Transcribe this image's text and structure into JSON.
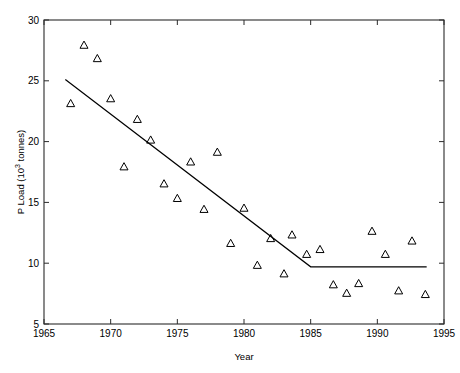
{
  "chart_data": {
    "type": "scatter",
    "title": "",
    "subtitle": "",
    "xlabel": "Year",
    "ylabel": "P Load (10^3 tonnes)",
    "ylabel_parts": {
      "pre": "P Load (10",
      "sup": "3",
      "post": " tonnes)"
    },
    "xlim": [
      1965,
      1995
    ],
    "ylim": [
      5,
      30
    ],
    "xticks": [
      1965,
      1970,
      1975,
      1980,
      1985,
      1990,
      1995
    ],
    "xtick_labels": [
      "1965",
      "1970",
      "1975",
      "1980",
      "1985",
      "1990",
      "1995"
    ],
    "yticks": [
      5,
      10,
      15,
      20,
      25,
      30
    ],
    "ytick_labels": [
      "5",
      "10",
      "15",
      "20",
      "25",
      "30"
    ],
    "grid": false,
    "legend": "none",
    "marker": "triangle-up-open",
    "marker_color": "#000000",
    "line_color": "#000000",
    "series": [
      {
        "name": "P Load observations",
        "type": "scatter",
        "points": [
          [
            1967.0,
            23.1
          ],
          [
            1968.0,
            27.9
          ],
          [
            1969.0,
            26.8
          ],
          [
            1970.0,
            23.5
          ],
          [
            1971.0,
            17.9
          ],
          [
            1972.0,
            21.8
          ],
          [
            1973.0,
            20.1
          ],
          [
            1974.0,
            16.5
          ],
          [
            1975.0,
            15.3
          ],
          [
            1976.0,
            18.3
          ],
          [
            1977.0,
            14.4
          ],
          [
            1978.0,
            19.1
          ],
          [
            1979.0,
            11.6
          ],
          [
            1980.0,
            14.5
          ],
          [
            1981.0,
            9.8
          ],
          [
            1982.0,
            12.0
          ],
          [
            1983.0,
            9.1
          ],
          [
            1983.6,
            12.3
          ],
          [
            1984.7,
            10.7
          ],
          [
            1985.7,
            11.1
          ],
          [
            1986.7,
            8.2
          ],
          [
            1987.7,
            7.5
          ],
          [
            1988.6,
            8.3
          ],
          [
            1989.6,
            12.6
          ],
          [
            1990.6,
            10.7
          ],
          [
            1991.6,
            7.7
          ],
          [
            1992.6,
            11.8
          ],
          [
            1993.6,
            7.4
          ]
        ]
      },
      {
        "name": "Fitted piecewise-linear trend",
        "type": "line",
        "points": [
          [
            1966.6,
            25.1
          ],
          [
            1985.0,
            9.7
          ],
          [
            1993.7,
            9.7
          ]
        ]
      }
    ]
  },
  "axes": {
    "frame_color": "#2b2b2b",
    "background": "#ffffff"
  }
}
